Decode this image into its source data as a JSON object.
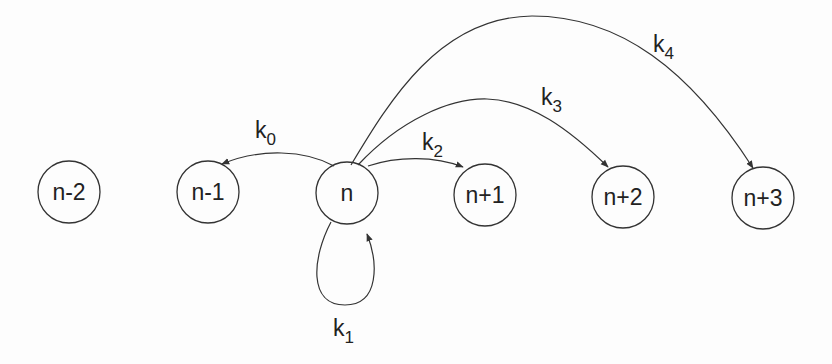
{
  "diagram": {
    "type": "state-transition-graph",
    "colors": {
      "stroke": "#333333",
      "text": "#222222",
      "background": "#fdfdfd"
    },
    "nodes": [
      {
        "id": "n-2",
        "label": "n-2"
      },
      {
        "id": "n-1",
        "label": "n-1"
      },
      {
        "id": "n",
        "label": "n"
      },
      {
        "id": "n+1",
        "label": "n+1"
      },
      {
        "id": "n+2",
        "label": "n+2"
      },
      {
        "id": "n+3",
        "label": "n+3"
      }
    ],
    "edges": [
      {
        "from": "n",
        "to": "n-1",
        "label": "k",
        "sub": "0"
      },
      {
        "from": "n",
        "to": "n",
        "label": "k",
        "sub": "1"
      },
      {
        "from": "n",
        "to": "n+1",
        "label": "k",
        "sub": "2"
      },
      {
        "from": "n",
        "to": "n+2",
        "label": "k",
        "sub": "3"
      },
      {
        "from": "n",
        "to": "n+3",
        "label": "k",
        "sub": "4"
      }
    ]
  }
}
